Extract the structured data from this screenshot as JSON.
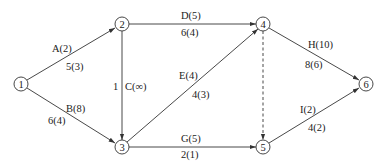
{
  "diagram": {
    "type": "activity-network",
    "nodes": [
      {
        "id": "1",
        "label": "1",
        "x": 21,
        "y": 84
      },
      {
        "id": "2",
        "label": "2",
        "x": 122,
        "y": 24
      },
      {
        "id": "3",
        "label": "3",
        "x": 122,
        "y": 147
      },
      {
        "id": "4",
        "label": "4",
        "x": 263,
        "y": 24
      },
      {
        "id": "5",
        "label": "5",
        "x": 263,
        "y": 147
      },
      {
        "id": "6",
        "label": "6",
        "x": 366,
        "y": 84
      }
    ],
    "edges": [
      {
        "from": "1",
        "to": "2",
        "activity": "A(2)",
        "value": "5(3)"
      },
      {
        "from": "1",
        "to": "3",
        "activity": "B(8)",
        "value": "6(4)"
      },
      {
        "from": "2",
        "to": "3",
        "activity": "C(∞)",
        "value": "1"
      },
      {
        "from": "2",
        "to": "4",
        "activity": "D(5)",
        "value": "6(4)"
      },
      {
        "from": "3",
        "to": "4",
        "activity": "E(4)",
        "value": "4(3)"
      },
      {
        "from": "3",
        "to": "5",
        "activity": "G(5)",
        "value": "2(1)"
      },
      {
        "from": "4",
        "to": "5",
        "activity": "",
        "value": "",
        "style": "dashed"
      },
      {
        "from": "4",
        "to": "6",
        "activity": "H(10)",
        "value": "8(6)"
      },
      {
        "from": "5",
        "to": "6",
        "activity": "I(2)",
        "value": "4(2)"
      }
    ]
  }
}
